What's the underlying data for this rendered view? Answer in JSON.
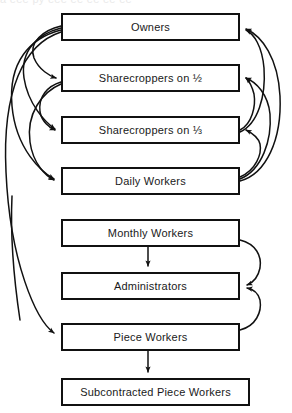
{
  "figure": {
    "clipped_header_text": "a eee py eee ee ee ee ee",
    "background_color": "#ffffff",
    "line_color": "#111111",
    "text_color": "#1a1a1a"
  },
  "nodes": [
    {
      "id": "owners",
      "label": "Owners",
      "x": 61,
      "y": 13,
      "width": 179,
      "height": 28
    },
    {
      "id": "sharecroppers-half",
      "label": "Sharecroppers on ½",
      "x": 61,
      "y": 64,
      "width": 179,
      "height": 28
    },
    {
      "id": "sharecroppers-third",
      "label": "Sharecroppers on ⅓",
      "x": 61,
      "y": 116,
      "width": 179,
      "height": 28
    },
    {
      "id": "daily-workers",
      "label": "Daily Workers",
      "x": 61,
      "y": 167,
      "width": 179,
      "height": 28
    },
    {
      "id": "monthly-workers",
      "label": "Monthly Workers",
      "x": 61,
      "y": 219,
      "width": 179,
      "height": 28
    },
    {
      "id": "administrators",
      "label": "Administrators",
      "x": 61,
      "y": 272,
      "width": 179,
      "height": 28
    },
    {
      "id": "piece-workers",
      "label": "Piece Workers",
      "x": 61,
      "y": 323,
      "width": 179,
      "height": 28
    },
    {
      "id": "subcontracted-piece-workers",
      "label": "Subcontracted Piece Workers",
      "x": 61,
      "y": 378,
      "width": 189,
      "height": 28
    }
  ],
  "edges": [
    {
      "id": "owners-to-sharecroppers-half",
      "from": "owners",
      "to": "sharecroppers-half",
      "side": "left",
      "style": "curved"
    },
    {
      "id": "owners-to-sharecroppers-third",
      "from": "owners",
      "to": "sharecroppers-third",
      "side": "left",
      "style": "curved"
    },
    {
      "id": "owners-to-daily-workers",
      "from": "owners",
      "to": "daily-workers",
      "side": "left",
      "style": "curved"
    },
    {
      "id": "owners-to-piece-workers",
      "from": "owners",
      "to": "piece-workers",
      "side": "left",
      "style": "curved-long"
    },
    {
      "id": "sharecroppers-half-to-sharecroppers-third",
      "from": "sharecroppers-half",
      "to": "sharecroppers-third",
      "side": "left",
      "style": "curved"
    },
    {
      "id": "sharecroppers-half-to-daily-workers",
      "from": "sharecroppers-half",
      "to": "daily-workers",
      "side": "left",
      "style": "curved"
    },
    {
      "id": "daily-workers-to-owners",
      "from": "daily-workers",
      "to": "owners",
      "side": "right",
      "style": "curved"
    },
    {
      "id": "daily-workers-to-sharecroppers-half",
      "from": "daily-workers",
      "to": "sharecroppers-half",
      "side": "right",
      "style": "curved"
    },
    {
      "id": "daily-workers-to-sharecroppers-third",
      "from": "daily-workers",
      "to": "sharecroppers-third",
      "side": "right",
      "style": "curved"
    },
    {
      "id": "sharecroppers-third-to-owners",
      "from": "sharecroppers-third",
      "to": "owners",
      "side": "right",
      "style": "curved"
    },
    {
      "id": "sharecroppers-third-to-sharecroppers-half",
      "from": "sharecroppers-third",
      "to": "sharecroppers-half",
      "side": "right",
      "style": "curved"
    },
    {
      "id": "monthly-workers-to-administrators-direct",
      "from": "monthly-workers",
      "to": "administrators",
      "side": "center",
      "style": "straight"
    },
    {
      "id": "monthly-workers-to-administrators-curve",
      "from": "monthly-workers",
      "to": "administrators",
      "side": "right",
      "style": "curved"
    },
    {
      "id": "piece-workers-to-administrators",
      "from": "piece-workers",
      "to": "administrators",
      "side": "right",
      "style": "curved"
    },
    {
      "id": "piece-workers-to-subcontracted",
      "from": "piece-workers",
      "to": "subcontracted-piece-workers",
      "side": "center",
      "style": "straight"
    }
  ]
}
